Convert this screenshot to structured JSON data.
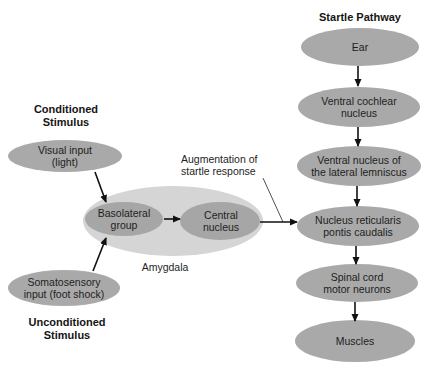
{
  "headings": {
    "conditioned": [
      "Conditioned",
      "Stimulus"
    ],
    "unconditioned": [
      "Unconditioned",
      "Stimulus"
    ],
    "startle": "Startle Pathway"
  },
  "inputs": {
    "visual": [
      "Visual input",
      "(light)"
    ],
    "somatosensory": [
      "Somatosensory",
      "input (foot shock)"
    ]
  },
  "amygdala": {
    "label": "Amygdala",
    "basolateral": [
      "Basolateral",
      "group"
    ],
    "central": [
      "Central",
      "nucleus"
    ]
  },
  "annotation": [
    "Augmentation of",
    "startle response"
  ],
  "startle_pathway": [
    {
      "id": "ear",
      "lines": [
        "Ear"
      ]
    },
    {
      "id": "ventral-cochlear",
      "lines": [
        "Ventral cochlear",
        "nucleus"
      ]
    },
    {
      "id": "lateral-lemniscus",
      "lines": [
        "Ventral nucleus of",
        "the lateral lemniscus"
      ]
    },
    {
      "id": "reticularis",
      "lines": [
        "Nucleus reticularis",
        "pontis caudalis"
      ]
    },
    {
      "id": "spinal-cord",
      "lines": [
        "Spinal cord",
        "motor neurons"
      ]
    },
    {
      "id": "muscles",
      "lines": [
        "Muscles"
      ]
    }
  ],
  "colors": {
    "node_fill": "#a9a9a9",
    "amygdala_fill": "#d5d5d5",
    "inner_fill": "#a6a6a6",
    "arrow": "#111111"
  }
}
